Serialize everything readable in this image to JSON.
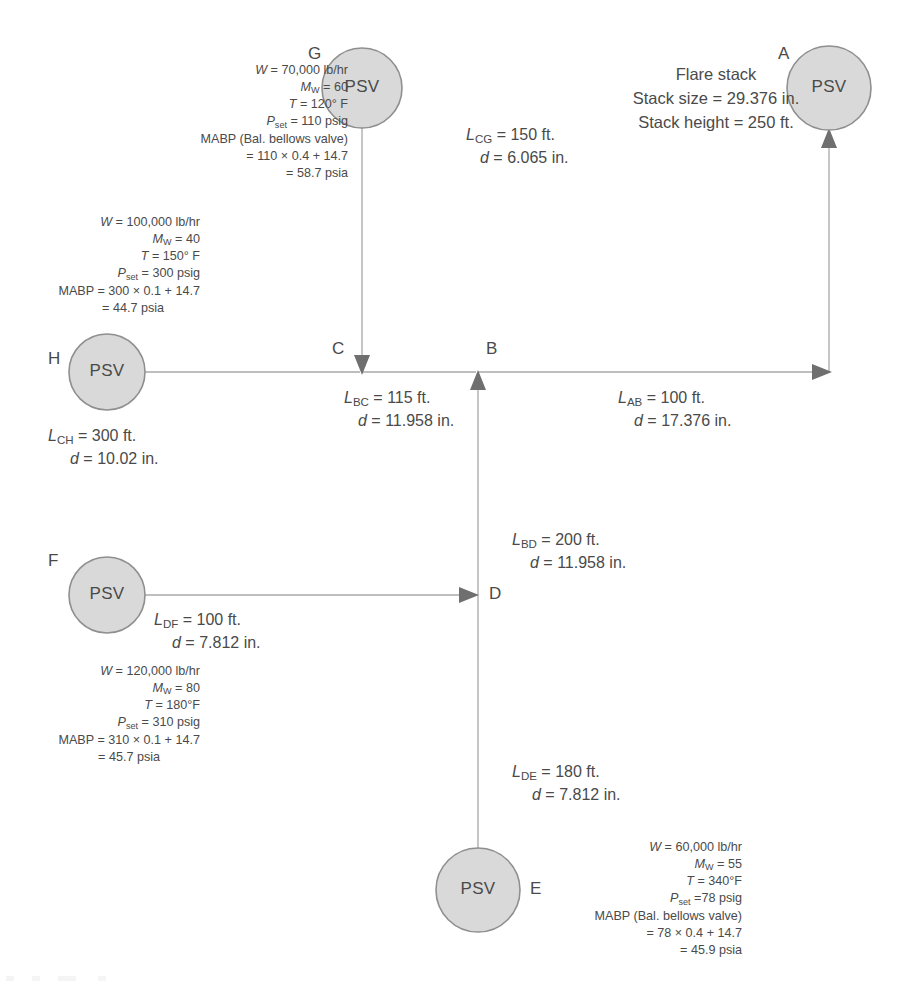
{
  "diagram": {
    "colors": {
      "node_fill": "#d9d9d9",
      "node_stroke": "#8f8f8f",
      "line": "#a8a8a8",
      "arrow": "#6f6f6f",
      "text": "#4a4a4a"
    },
    "psv_label": "PSV",
    "nodes": [
      {
        "id": "A",
        "letter": "A",
        "label": "PSV",
        "cx": 829,
        "cy": 88,
        "r": 42
      },
      {
        "id": "G",
        "letter": "G",
        "label": "PSV",
        "cx": 362,
        "cy": 88,
        "r": 40
      },
      {
        "id": "H",
        "letter": "H",
        "label": "PSV",
        "cx": 107,
        "cy": 372,
        "r": 38
      },
      {
        "id": "F",
        "letter": "F",
        "label": "PSV",
        "cx": 107,
        "cy": 595,
        "r": 38
      },
      {
        "id": "E",
        "letter": "E",
        "label": "PSV",
        "cx": 478,
        "cy": 890,
        "r": 42
      },
      {
        "id": "C",
        "letter": "C",
        "cx": 362,
        "cy": 372,
        "r": 0
      },
      {
        "id": "B",
        "letter": "B",
        "cx": 478,
        "cy": 372,
        "r": 0
      },
      {
        "id": "D",
        "letter": "D",
        "cx": 478,
        "cy": 595,
        "r": 0
      }
    ],
    "flare_stack": {
      "title": "Flare stack",
      "size": "Stack size = 29.376 in.",
      "height": "Stack height = 250 ft."
    },
    "segments": [
      {
        "id": "CG",
        "length_label": "L",
        "length_sub": "CG",
        "length_value": " = 150 ft.",
        "dia_label": "d",
        "dia_value": " = 6.065 in."
      },
      {
        "id": "AB",
        "length_label": "L",
        "length_sub": "AB",
        "length_value": " = 100 ft.",
        "dia_label": "d",
        "dia_value": " = 17.376 in."
      },
      {
        "id": "BC",
        "length_label": "L",
        "length_sub": "BC",
        "length_value": " = 115 ft.",
        "dia_label": "d",
        "dia_value": " = 11.958 in."
      },
      {
        "id": "CH",
        "length_label": "L",
        "length_sub": "CH",
        "length_value": " = 300 ft.",
        "dia_label": "d",
        "dia_value": " = 10.02 in."
      },
      {
        "id": "BD",
        "length_label": "L",
        "length_sub": "BD",
        "length_value": " = 200 ft.",
        "dia_label": "d",
        "dia_value": " = 11.958 in."
      },
      {
        "id": "DF",
        "length_label": "L",
        "length_sub": "DF",
        "length_value": " = 100 ft.",
        "dia_label": "d",
        "dia_value": " = 7.812 in."
      },
      {
        "id": "DE",
        "length_label": "L",
        "length_sub": "DE",
        "length_value": " = 180 ft.",
        "dia_label": "d",
        "dia_value": " = 7.812 in."
      }
    ],
    "specs": {
      "G": {
        "flow": " = 70,000 lb/hr",
        "mw": " = 60",
        "temp": " = 120° F",
        "pset": " = 110 psig",
        "mabp_head": "MABP (Bal. bellows valve)",
        "mabp_calc": "= 110 × 0.4 + 14.7",
        "mabp_result": "= 58.7 psia"
      },
      "H": {
        "flow": " = 100,000 lb/hr",
        "mw": " = 40",
        "temp": " = 150° F",
        "pset": " = 300 psig",
        "mabp_head": "MABP = 300 × 0.1 + 14.7",
        "mabp_result": "= 44.7 psia"
      },
      "F": {
        "flow": " = 120,000 lb/hr",
        "mw": " = 80",
        "temp": " = 180°F",
        "pset": " = 310 psig",
        "mabp_head": "MABP = 310 × 0.1 + 14.7",
        "mabp_result": "= 45.7 psia"
      },
      "E": {
        "flow": " = 60,000 lb/hr",
        "mw": " = 55",
        "temp": " = 340°F",
        "pset": " =78 psig",
        "mabp_head": "MABP (Bal. bellows valve)",
        "mabp_calc": "= 78 × 0.4 + 14.7",
        "mabp_result": "= 45.9 psia"
      }
    },
    "symbols": {
      "W": "W",
      "M": "M",
      "M_sub": "W",
      "T": "T",
      "P": "P",
      "P_sub": "set"
    }
  }
}
